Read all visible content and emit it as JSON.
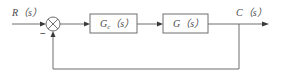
{
  "diagram": {
    "type": "closed-loop feedback control block diagram",
    "input_label": "R（s）",
    "output_label": "C（s）",
    "summing_junction": {
      "feedback_sign": "−"
    },
    "blocks": [
      {
        "id": "controller",
        "label": "Gc（s）",
        "label_main": "G",
        "label_sub": "c",
        "label_rest": "（s）"
      },
      {
        "id": "plant",
        "label": "G（s）"
      }
    ],
    "feedback": "unity negative feedback from C(s) to summing junction"
  }
}
